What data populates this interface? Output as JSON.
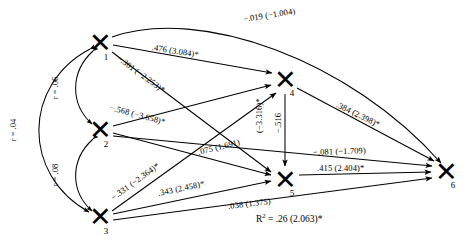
{
  "diagram": {
    "type": "path-analysis-diagram",
    "nodes": [
      {
        "id": "1",
        "label": "1",
        "glyph": "x-node-glyph",
        "x": 100,
        "y": 43
      },
      {
        "id": "2",
        "label": "2",
        "glyph": "x-node-glyph",
        "x": 100,
        "y": 130
      },
      {
        "id": "3",
        "label": "3",
        "glyph": "x-node-glyph",
        "x": 100,
        "y": 217
      },
      {
        "id": "4",
        "label": "4",
        "glyph": "x-node-glyph",
        "x": 285,
        "y": 80
      },
      {
        "id": "5",
        "label": "5",
        "glyph": "x-node-glyph",
        "x": 285,
        "y": 180
      },
      {
        "id": "6",
        "label": "6",
        "glyph": "x-node-glyph",
        "x": 446,
        "y": 172
      }
    ],
    "correlations": [
      {
        "id": "r-1-2",
        "text": "r = .06",
        "from": "1",
        "to": "2"
      },
      {
        "id": "r-2-3",
        "text": "r = .08",
        "from": "2",
        "to": "3"
      },
      {
        "id": "r-1-3",
        "text": "r = .04",
        "from": "1",
        "to": "3"
      }
    ],
    "paths": [
      {
        "id": "p-1-6",
        "from": "1",
        "to": "6",
        "coefficient": "−.019",
        "t_value": "(−1.004)",
        "significant": false,
        "text": "−.019 (−1.004)"
      },
      {
        "id": "p-1-4",
        "from": "1",
        "to": "4",
        "coefficient": ".476",
        "t_value": "(3.084)",
        "significant": true,
        "text": ".476 (3.084)*"
      },
      {
        "id": "p-1-5",
        "from": "1",
        "to": "5",
        "coefficient": "−.301",
        "t_value": "(−2.253)",
        "significant": true,
        "text": "−.301 (−2.253)*"
      },
      {
        "id": "p-2-5",
        "from": "2",
        "to": "5",
        "coefficient": "−.568",
        "t_value": "(−3.658)",
        "significant": true,
        "text": "−.568 (−3.658)*"
      },
      {
        "id": "p-2-4",
        "from": "2",
        "to": "4",
        "coefficient": ".075",
        "t_value": "(1.691)",
        "significant": false,
        "text": ".075 (1.691)"
      },
      {
        "id": "p-3-4",
        "from": "3",
        "to": "4",
        "coefficient": "−.331",
        "t_value": "(−2.364)",
        "significant": true,
        "text": "−.331 (−2.364)*"
      },
      {
        "id": "p-3-5",
        "from": "3",
        "to": "5",
        "coefficient": ".343",
        "t_value": "(2.458)",
        "significant": true,
        "text": ".343 (2.458)*"
      },
      {
        "id": "p-3-6",
        "from": "3",
        "to": "6",
        "coefficient": ".038",
        "t_value": "(1.375)",
        "significant": false,
        "text": ".038 (1.375)"
      },
      {
        "id": "p-4-5",
        "from": "4",
        "to": "5",
        "coefficient": "−.516",
        "t_value": "(−3.316)",
        "significant": true,
        "text": "−.516",
        "text2": "(−3.316)*"
      },
      {
        "id": "p-4-6",
        "from": "4",
        "to": "6",
        "coefficient": ".384",
        "t_value": "(2.398)",
        "significant": true,
        "text": ".384 (2.398)*"
      },
      {
        "id": "p-2-6",
        "from": "2",
        "to": "6",
        "coefficient": "−.081",
        "t_value": "(−1.709)",
        "significant": false,
        "text": "−.081 (−1.709)"
      },
      {
        "id": "p-5-6",
        "from": "5",
        "to": "6",
        "coefficient": ".415",
        "t_value": "(2.404)",
        "significant": true,
        "text": ".415 (2.404)*"
      }
    ],
    "statistics": {
      "r_squared_label": "R",
      "r_squared_sup": "2",
      "r_squared_text": " = .26 (2.063)*"
    },
    "node_glyph_char": "✕"
  }
}
